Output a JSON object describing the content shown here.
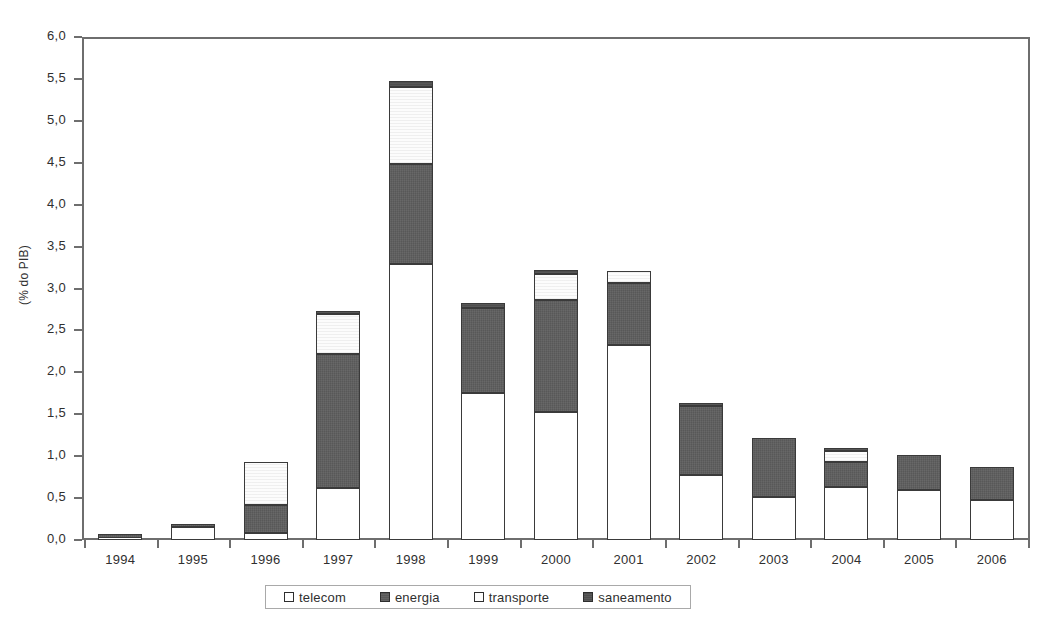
{
  "chart_data": {
    "type": "bar",
    "stacked": true,
    "title": "",
    "subtitle": "",
    "xlabel": "",
    "ylabel": "(% do PIB)",
    "ylim": [
      0.0,
      6.0
    ],
    "ytick_labels": [
      "6,0",
      "5,5",
      "5,0",
      "4,5",
      "4,0",
      "3,5",
      "3,0",
      "2,5",
      "2,0",
      "1,5",
      "1,0",
      "0,5",
      "0,0"
    ],
    "ytick_values": [
      6.0,
      5.5,
      5.0,
      4.5,
      4.0,
      3.5,
      3.0,
      2.5,
      2.0,
      1.5,
      1.0,
      0.5,
      0.0
    ],
    "grid": false,
    "legend_position": "bottom",
    "categories": [
      "1994",
      "1995",
      "1996",
      "1997",
      "1998",
      "1999",
      "2000",
      "2001",
      "2002",
      "2003",
      "2004",
      "2005",
      "2006"
    ],
    "series": [
      {
        "name": "telecom",
        "color": "#ffffff",
        "values": [
          0.03,
          0.15,
          0.08,
          0.62,
          3.3,
          1.76,
          1.53,
          2.34,
          0.78,
          0.52,
          0.64,
          0.6,
          0.48
        ]
      },
      {
        "name": "energia",
        "color": "#585858",
        "values": [
          0.04,
          0.03,
          0.34,
          1.61,
          1.2,
          1.02,
          1.35,
          0.74,
          0.83,
          0.7,
          0.29,
          0.42,
          0.39
        ]
      },
      {
        "name": "transporte",
        "color": "#fcfcfc",
        "values": [
          0.0,
          0.0,
          0.51,
          0.48,
          0.93,
          0.0,
          0.3,
          0.14,
          0.0,
          0.0,
          0.14,
          0.0,
          0.0
        ]
      },
      {
        "name": "saneamento",
        "color": "#4e4e4e",
        "values": [
          0.0,
          0.0,
          0.0,
          0.03,
          0.07,
          0.06,
          0.05,
          0.0,
          0.03,
          0.0,
          0.03,
          0.0,
          0.0
        ]
      }
    ],
    "totals": [
      0.07,
      0.18,
      0.93,
      2.74,
      5.5,
      2.84,
      3.23,
      3.22,
      1.64,
      1.22,
      1.1,
      1.02,
      0.87
    ]
  },
  "legend": {
    "items": [
      {
        "label": "telecom",
        "swatch": "telecom"
      },
      {
        "label": "energia",
        "swatch": "energia"
      },
      {
        "label": "transporte",
        "swatch": "transporte"
      },
      {
        "label": "saneamento",
        "swatch": "saneamento"
      }
    ]
  }
}
